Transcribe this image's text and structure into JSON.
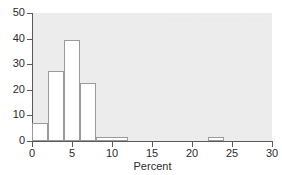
{
  "chart_data": {
    "type": "bar",
    "title": "",
    "subtitle": "",
    "xlabel": "Percent",
    "ylabel": "",
    "xlim": [
      0,
      30
    ],
    "ylim": [
      0,
      50
    ],
    "xticks": [
      0,
      5,
      10,
      15,
      20,
      25,
      30
    ],
    "yticks": [
      0,
      10,
      20,
      30,
      40,
      50
    ],
    "grid": false,
    "legend": null,
    "histogram": true,
    "bin_edges": [
      0,
      2,
      4,
      6,
      8,
      12,
      22,
      24
    ],
    "bins": [
      {
        "start": 0,
        "end": 2,
        "value": 7.0
      },
      {
        "start": 2,
        "end": 4,
        "value": 27.5
      },
      {
        "start": 4,
        "end": 6,
        "value": 39.5
      },
      {
        "start": 6,
        "end": 8,
        "value": 22.5
      },
      {
        "start": 8,
        "end": 12,
        "value": 1.5
      },
      {
        "start": 22,
        "end": 24,
        "value": 1.5
      }
    ],
    "categories": [
      "0-2",
      "2-4",
      "4-6",
      "6-8",
      "8-12",
      "22-24"
    ],
    "values": [
      7.0,
      27.5,
      39.5,
      22.5,
      1.5,
      1.5
    ],
    "colors": {
      "plot_background": "#ececec",
      "figure_background": "#ffffff",
      "bar_fill": "#ffffff",
      "bar_edge": "#9a9a9a",
      "axis": "#5a5a5a",
      "text": "#2b2b2b",
      "watermark": "#e4e4e4"
    },
    "watermark_text": "........ ..... .... ...."
  }
}
